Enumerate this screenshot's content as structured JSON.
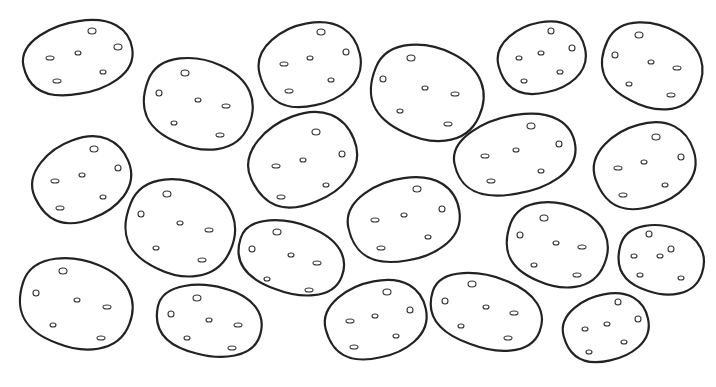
{
  "image": {
    "description": "Coloring page of outlined potatoes with small eye marks",
    "background": "#ffffff",
    "stroke_color": "#222222",
    "potato_count": 20,
    "potatoes": [
      {
        "cx": 78,
        "cy": 58,
        "rx": 55,
        "ry": 36,
        "rot": -12,
        "eyes": [
          [
            92,
            31,
            4,
            3
          ],
          [
            118,
            47,
            4,
            3
          ],
          [
            78,
            53,
            3,
            2
          ],
          [
            50,
            58,
            4,
            2
          ],
          [
            103,
            72,
            3,
            2
          ],
          [
            57,
            81,
            4,
            2
          ]
        ]
      },
      {
        "cx": 198,
        "cy": 104,
        "rx": 55,
        "ry": 44,
        "rot": 20,
        "eyes": [
          [
            185,
            73,
            4,
            3
          ],
          [
            159,
            93,
            3,
            3
          ],
          [
            198,
            100,
            3,
            2
          ],
          [
            226,
            106,
            4,
            2
          ],
          [
            174,
            123,
            3,
            2
          ],
          [
            220,
            135,
            4,
            2
          ]
        ]
      },
      {
        "cx": 310,
        "cy": 65,
        "rx": 51,
        "ry": 41,
        "rot": -15,
        "eyes": [
          [
            321,
            32,
            4,
            3
          ],
          [
            346,
            52,
            3,
            3
          ],
          [
            310,
            58,
            3,
            2
          ],
          [
            284,
            64,
            4,
            2
          ],
          [
            331,
            80,
            3,
            2
          ],
          [
            289,
            91,
            4,
            2
          ]
        ]
      },
      {
        "cx": 427,
        "cy": 93,
        "rx": 57,
        "ry": 46,
        "rot": 22,
        "eyes": [
          [
            411,
            58,
            4,
            3
          ],
          [
            383,
            79,
            3,
            3
          ],
          [
            425,
            88,
            3,
            2
          ],
          [
            455,
            94,
            4,
            2
          ],
          [
            400,
            111,
            3,
            2
          ],
          [
            448,
            124,
            4,
            2
          ]
        ]
      },
      {
        "cx": 542,
        "cy": 58,
        "rx": 44,
        "ry": 35,
        "rot": -15,
        "eyes": [
          [
            551,
            31,
            3,
            3
          ],
          [
            572,
            48,
            3,
            3
          ],
          [
            541,
            53,
            3,
            2
          ],
          [
            519,
            58,
            3,
            2
          ],
          [
            560,
            72,
            3,
            2
          ],
          [
            524,
            81,
            3,
            2
          ]
        ]
      },
      {
        "cx": 652,
        "cy": 66,
        "rx": 51,
        "ry": 41,
        "rot": 25,
        "eyes": [
          [
            639,
            35,
            4,
            3
          ],
          [
            615,
            55,
            3,
            3
          ],
          [
            651,
            62,
            3,
            2
          ],
          [
            677,
            68,
            4,
            2
          ],
          [
            629,
            84,
            3,
            2
          ],
          [
            671,
            95,
            4,
            2
          ]
        ]
      },
      {
        "cx": 82,
        "cy": 180,
        "rx": 50,
        "ry": 40,
        "rot": -25,
        "eyes": [
          [
            94,
            149,
            4,
            3
          ],
          [
            118,
            168,
            3,
            3
          ],
          [
            82,
            175,
            3,
            2
          ],
          [
            55,
            181,
            4,
            2
          ],
          [
            103,
            197,
            3,
            2
          ],
          [
            60,
            208,
            4,
            2
          ]
        ]
      },
      {
        "cx": 303,
        "cy": 160,
        "rx": 55,
        "ry": 44,
        "rot": -25,
        "eyes": [
          [
            316,
            132,
            4,
            3
          ],
          [
            342,
            154,
            3,
            3
          ],
          [
            303,
            160,
            3,
            2
          ],
          [
            276,
            166,
            4,
            2
          ],
          [
            326,
            185,
            3,
            2
          ],
          [
            281,
            197,
            4,
            2
          ]
        ]
      },
      {
        "cx": 515,
        "cy": 155,
        "rx": 61,
        "ry": 39,
        "rot": -12,
        "eyes": [
          [
            531,
            126,
            4,
            3
          ],
          [
            559,
            144,
            3,
            3
          ],
          [
            516,
            150,
            3,
            2
          ],
          [
            485,
            156,
            4,
            2
          ],
          [
            541,
            171,
            3,
            2
          ],
          [
            491,
            181,
            4,
            2
          ]
        ]
      },
      {
        "cx": 645,
        "cy": 166,
        "rx": 51,
        "ry": 41,
        "rot": -20,
        "eyes": [
          [
            656,
            137,
            4,
            3
          ],
          [
            681,
            157,
            3,
            3
          ],
          [
            644,
            162,
            3,
            2
          ],
          [
            618,
            168,
            4,
            2
          ],
          [
            665,
            185,
            3,
            2
          ],
          [
            623,
            195,
            4,
            2
          ]
        ]
      },
      {
        "cx": 180,
        "cy": 228,
        "rx": 55,
        "ry": 47,
        "rot": 22,
        "eyes": [
          [
            167,
            194,
            4,
            3
          ],
          [
            141,
            214,
            3,
            3
          ],
          [
            180,
            223,
            3,
            2
          ],
          [
            209,
            230,
            4,
            2
          ],
          [
            156,
            248,
            3,
            2
          ],
          [
            202,
            260,
            4,
            2
          ]
        ]
      },
      {
        "cx": 404,
        "cy": 220,
        "rx": 56,
        "ry": 41,
        "rot": -12,
        "eyes": [
          [
            417,
            189,
            4,
            3
          ],
          [
            442,
            209,
            3,
            3
          ],
          [
            404,
            215,
            3,
            2
          ],
          [
            375,
            220,
            4,
            2
          ],
          [
            428,
            237,
            3,
            2
          ],
          [
            381,
            248,
            4,
            2
          ]
        ]
      },
      {
        "cx": 291,
        "cy": 258,
        "rx": 54,
        "ry": 35,
        "rot": 18,
        "eyes": [
          [
            277,
            232,
            4,
            3
          ],
          [
            252,
            249,
            3,
            3
          ],
          [
            291,
            255,
            3,
            2
          ],
          [
            317,
            263,
            4,
            2
          ],
          [
            267,
            279,
            3,
            2
          ],
          [
            309,
            290,
            4,
            2
          ]
        ]
      },
      {
        "cx": 557,
        "cy": 245,
        "rx": 51,
        "ry": 41,
        "rot": 20,
        "eyes": [
          [
            544,
            218,
            4,
            3
          ],
          [
            520,
            235,
            3,
            3
          ],
          [
            556,
            243,
            3,
            2
          ],
          [
            582,
            247,
            4,
            2
          ],
          [
            534,
            265,
            3,
            2
          ],
          [
            577,
            275,
            4,
            2
          ]
        ]
      },
      {
        "cx": 661,
        "cy": 260,
        "rx": 43,
        "ry": 34,
        "rot": 15,
        "eyes": [
          [
            649,
            234,
            3,
            3
          ],
          [
            671,
            249,
            3,
            3
          ],
          [
            660,
            256,
            3,
            2
          ],
          [
            634,
            256,
            3,
            2
          ],
          [
            640,
            275,
            3,
            2
          ],
          [
            681,
            278,
            3,
            2
          ]
        ]
      },
      {
        "cx": 76,
        "cy": 304,
        "rx": 57,
        "ry": 44,
        "rot": 18,
        "eyes": [
          [
            63,
            271,
            4,
            3
          ],
          [
            36,
            293,
            3,
            3
          ],
          [
            77,
            300,
            3,
            2
          ],
          [
            107,
            307,
            4,
            2
          ],
          [
            53,
            325,
            3,
            2
          ],
          [
            101,
            338,
            4,
            2
          ]
        ]
      },
      {
        "cx": 209,
        "cy": 321,
        "rx": 53,
        "ry": 35,
        "rot": 12,
        "eyes": [
          [
            197,
            298,
            4,
            3
          ],
          [
            171,
            314,
            3,
            3
          ],
          [
            209,
            320,
            3,
            2
          ],
          [
            238,
            325,
            4,
            2
          ],
          [
            187,
            338,
            3,
            2
          ],
          [
            232,
            348,
            4,
            2
          ]
        ]
      },
      {
        "cx": 376,
        "cy": 320,
        "rx": 51,
        "ry": 38,
        "rot": -15,
        "eyes": [
          [
            387,
            292,
            4,
            3
          ],
          [
            410,
            310,
            3,
            3
          ],
          [
            375,
            316,
            3,
            2
          ],
          [
            350,
            321,
            4,
            2
          ],
          [
            396,
            336,
            3,
            2
          ],
          [
            354,
            347,
            4,
            2
          ]
        ]
      },
      {
        "cx": 486,
        "cy": 312,
        "rx": 57,
        "ry": 36,
        "rot": 18,
        "eyes": [
          [
            472,
            284,
            4,
            3
          ],
          [
            445,
            301,
            3,
            3
          ],
          [
            486,
            307,
            3,
            2
          ],
          [
            514,
            313,
            4,
            2
          ],
          [
            461,
            326,
            3,
            2
          ],
          [
            508,
            338,
            4,
            2
          ]
        ]
      },
      {
        "cx": 606,
        "cy": 328,
        "rx": 43,
        "ry": 33,
        "rot": -15,
        "eyes": [
          [
            618,
            302,
            3,
            3
          ],
          [
            638,
            319,
            3,
            3
          ],
          [
            607,
            324,
            3,
            2
          ],
          [
            585,
            329,
            3,
            2
          ],
          [
            624,
            342,
            3,
            2
          ],
          [
            589,
            352,
            3,
            2
          ]
        ]
      }
    ]
  }
}
